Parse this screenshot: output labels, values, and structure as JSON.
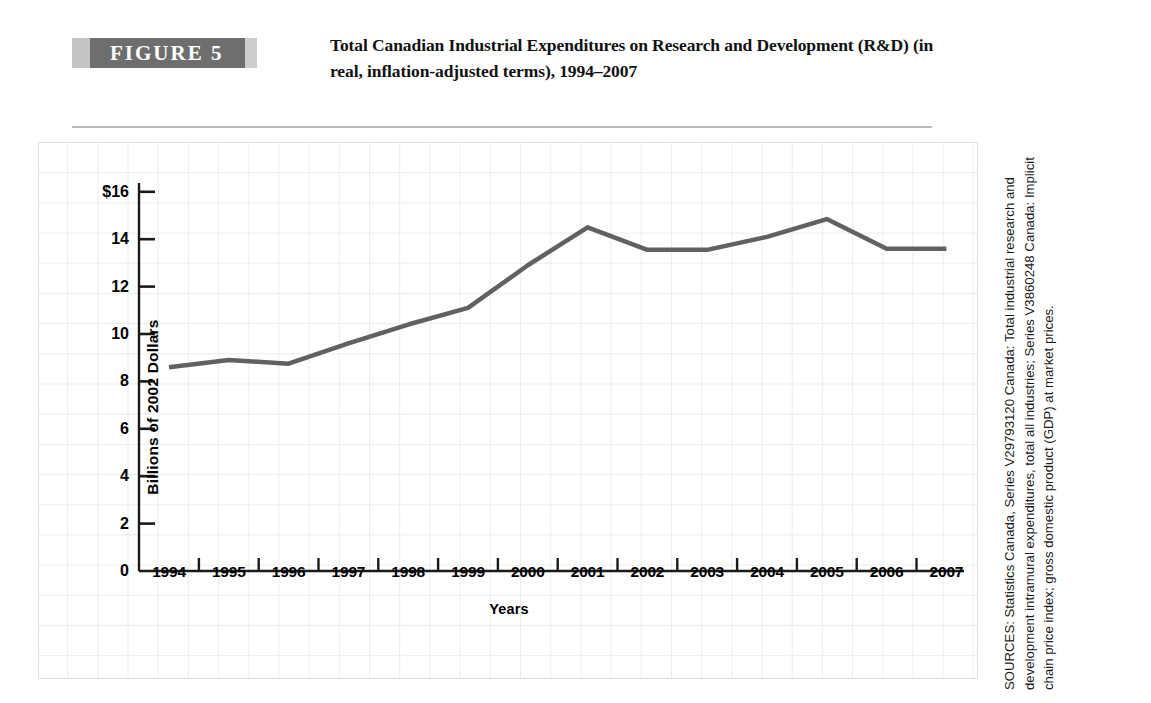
{
  "figure": {
    "badge_label": "FIGURE 5",
    "title": "Total Canadian Industrial Expenditures on Research and Development (R&D) (in real, inflation-adjusted terms), 1994–2007"
  },
  "source": {
    "text": "SOURCES: Statistics Canada, Series V29793120 Canada: Total industrial research and development intramural expenditures, total all industries; Series V3860248 Canada: Implicit chain price index; gross domestic product (GDP) at market prices."
  },
  "colors": {
    "badge_background": "#6e6e6e",
    "badge_side_band": "#c3c3c3",
    "line": "#616161",
    "grid": "#ececec",
    "axis": "#000000",
    "rule": "#b9b9b9"
  },
  "chart_data": {
    "type": "line",
    "title": "Total Canadian Industrial Expenditures on Research and Development (R&D) (in real, inflation-adjusted terms), 1994–2007",
    "xlabel": "Years",
    "ylabel": "Billions of 2002 Dollars",
    "categories": [
      "1994",
      "1995",
      "1996",
      "1997",
      "1998",
      "1999",
      "2000",
      "2001",
      "2002",
      "2003",
      "2004",
      "2005",
      "2006",
      "2007"
    ],
    "values": [
      8.6,
      8.9,
      8.75,
      9.6,
      10.4,
      11.1,
      12.9,
      14.5,
      13.55,
      13.55,
      14.1,
      14.85,
      13.6,
      13.6
    ],
    "series": [
      {
        "name": "Total industrial R&D expenditures",
        "values": [
          8.6,
          8.9,
          8.75,
          9.6,
          10.4,
          11.1,
          12.9,
          14.5,
          13.55,
          13.55,
          14.1,
          14.85,
          13.6,
          13.6
        ]
      }
    ],
    "ylim": [
      0,
      17
    ],
    "ytick_values": [
      0,
      2,
      4,
      6,
      8,
      10,
      12,
      14,
      16
    ],
    "ytick_labels": [
      "0",
      "2",
      "4",
      "6",
      "8",
      "10",
      "12",
      "14",
      "$16"
    ],
    "xtick_labels": [
      "1994",
      "1995",
      "1996",
      "1997",
      "1998",
      "1999",
      "2000",
      "2001",
      "2002",
      "2003",
      "2004",
      "2005",
      "2006",
      "2007"
    ],
    "grid": true,
    "legend": false,
    "units": "Billions of 2002 Dollars"
  }
}
